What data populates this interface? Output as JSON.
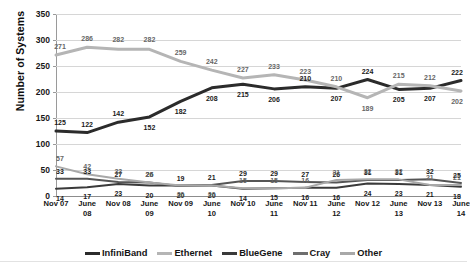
{
  "chart_data": {
    "type": "line",
    "title": "",
    "xlabel": "",
    "ylabel": "Number of Systems",
    "ylim": [
      0,
      350
    ],
    "yticks": [
      0,
      50,
      100,
      150,
      200,
      250,
      300,
      350
    ],
    "grid": true,
    "legend_position": "bottom",
    "categories": [
      "Nov 07",
      "June 08",
      "Nov 08",
      "June 09",
      "Nov 09",
      "June 10",
      "Nov 10",
      "June 11",
      "Nov 11",
      "June 12",
      "Nov 12",
      "June 13",
      "Nov 13",
      "June 14"
    ],
    "category_lines": [
      [
        "Nov 07",
        ""
      ],
      [
        "June",
        "08"
      ],
      [
        "Nov 08",
        ""
      ],
      [
        "June",
        "09"
      ],
      [
        "Nov 09",
        ""
      ],
      [
        "June",
        "10"
      ],
      [
        "Nov 10",
        ""
      ],
      [
        "June",
        "11"
      ],
      [
        "Nov 11",
        ""
      ],
      [
        "June",
        "12"
      ],
      [
        "Nov 12",
        ""
      ],
      [
        "June",
        "13"
      ],
      [
        "Nov 13",
        ""
      ],
      [
        "June",
        "14"
      ]
    ],
    "series": [
      {
        "name": "InfiniBand",
        "color": "#2b2b2b",
        "width": 3,
        "values": [
          125,
          122,
          142,
          152,
          182,
          208,
          215,
          206,
          210,
          207,
          224,
          205,
          207,
          222
        ],
        "labels": [
          "125",
          "122",
          "142",
          "152",
          "182",
          "208",
          "215",
          "206",
          "210",
          "207",
          "224",
          "205",
          "207",
          "222"
        ]
      },
      {
        "name": "Ethernet",
        "color": "#b5b5b5",
        "width": 3,
        "values": [
          271,
          286,
          282,
          282,
          259,
          242,
          227,
          233,
          223,
          210,
          189,
          215,
          212,
          202
        ],
        "labels": [
          "271",
          "286",
          "282",
          "282",
          "259",
          "242",
          "227",
          "233",
          "223",
          "210",
          "189",
          "215",
          "212",
          "202"
        ]
      },
      {
        "name": "BlueGene",
        "color": "#3a3a3a",
        "width": 2,
        "values": [
          14,
          17,
          23,
          20,
          20,
          20,
          14,
          15,
          16,
          16,
          24,
          23,
          21,
          18
        ],
        "labels": [
          "14",
          "17",
          "23",
          "20",
          "20",
          "20",
          "14",
          "15",
          "16",
          "16",
          "24",
          "23",
          "21",
          "18"
        ]
      },
      {
        "name": "Cray",
        "color": "#555555",
        "width": 2,
        "values": [
          33,
          33,
          27,
          26,
          19,
          21,
          29,
          29,
          27,
          26,
          31,
          31,
          32,
          25
        ],
        "labels": [
          "33",
          "33",
          "27",
          "26",
          "19",
          "21",
          "29",
          "29",
          "27",
          "26",
          "31",
          "31",
          "32",
          "25"
        ]
      },
      {
        "name": "Other",
        "color": "#a8a8a8",
        "width": 2,
        "values": [
          57,
          42,
          33,
          26,
          20,
          20,
          15,
          15,
          16,
          31,
          32,
          32,
          21,
          21
        ],
        "labels": [
          "57",
          "42",
          "33",
          "26",
          "20",
          "20",
          "15",
          "15",
          "16",
          "31",
          "32",
          "32",
          "21",
          "21"
        ]
      }
    ],
    "legend": [
      {
        "label": "InfiniBand",
        "color": "#2b2b2b"
      },
      {
        "label": "Ethernet",
        "color": "#b5b5b5"
      },
      {
        "label": "BlueGene",
        "color": "#3a3a3a"
      },
      {
        "label": "Cray",
        "color": "#6e6e6e"
      },
      {
        "label": "Other",
        "color": "#a8a8a8"
      }
    ]
  }
}
